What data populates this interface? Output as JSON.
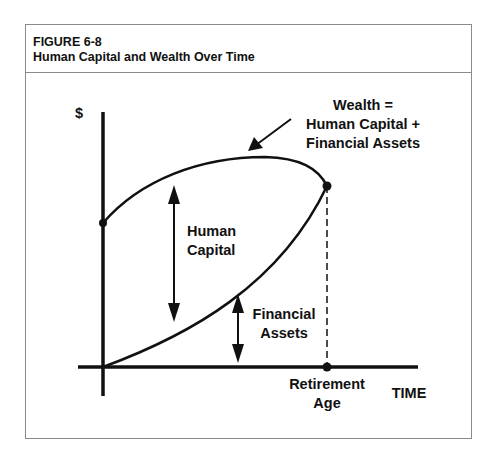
{
  "figure": {
    "number": "FIGURE 6-8",
    "title": "Human Capital and Wealth Over Time"
  },
  "diagram": {
    "y_axis_label": "$",
    "x_axis_label": "TIME",
    "wealth_label_lines": [
      "Wealth =",
      "Human Capital +",
      "Financial Assets"
    ],
    "human_capital_label_lines": [
      "Human",
      "Capital"
    ],
    "financial_assets_label_lines": [
      "Financial",
      "Assets"
    ],
    "retirement_label_lines": [
      "Retirement",
      "Age"
    ],
    "line_color": "#111111",
    "frame_color": "#8a8a8a"
  }
}
